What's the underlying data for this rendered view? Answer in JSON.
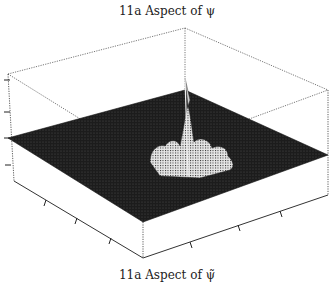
{
  "figure": {
    "title_top": "11a Aspect of ψ",
    "title_bottom": "11a Aspect of ψ̃",
    "type": "3D surface plot (mesh)",
    "colors": {
      "surface": "#1a1a1a",
      "peaks": "#d8d8d8",
      "box": "#444444"
    }
  }
}
